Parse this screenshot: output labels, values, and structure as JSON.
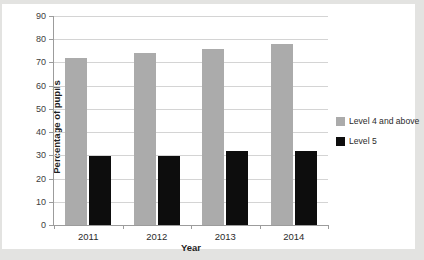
{
  "page": {
    "clipped_heading": "",
    "background_color": "#e3e3e1",
    "card_color": "#ffffff"
  },
  "chart_data": {
    "type": "bar",
    "title": "",
    "xlabel": "Year",
    "ylabel": "Percentage of pupils",
    "categories": [
      "2011",
      "2012",
      "2013",
      "2014"
    ],
    "series": [
      {
        "name": "Level 4 and above",
        "color": "#ababab",
        "values": [
          72,
          74,
          76,
          78
        ]
      },
      {
        "name": "Level 5",
        "color": "#0d0d0d",
        "values": [
          29.7,
          29.7,
          32,
          32
        ]
      }
    ],
    "ylim": [
      0,
      90
    ],
    "ytick_step": 10,
    "yticks": [
      "0",
      "10",
      "20",
      "30",
      "40",
      "50",
      "60",
      "70",
      "80",
      "90"
    ],
    "grid": true,
    "legend_position": "right"
  }
}
